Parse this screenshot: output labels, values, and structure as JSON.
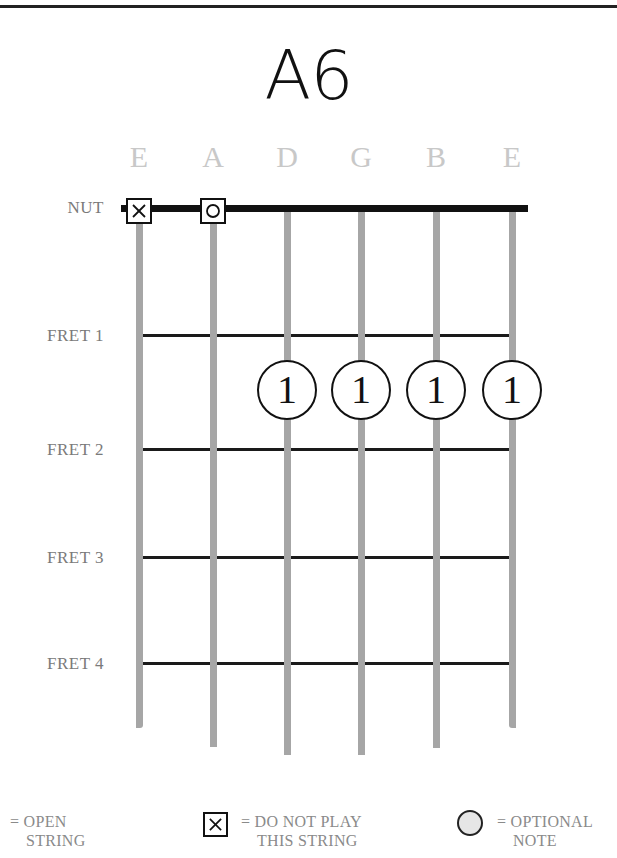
{
  "chord": {
    "name": "A6"
  },
  "strings": [
    {
      "name": "E",
      "x": 139,
      "bottom": 728,
      "marker": "x"
    },
    {
      "name": "A",
      "x": 213,
      "bottom": 747,
      "marker": "o"
    },
    {
      "name": "D",
      "x": 287,
      "bottom": 755,
      "marker": null
    },
    {
      "name": "G",
      "x": 361,
      "bottom": 755,
      "marker": null
    },
    {
      "name": "B",
      "x": 436,
      "bottom": 748,
      "marker": null
    },
    {
      "name": "E",
      "x": 512,
      "bottom": 728,
      "marker": null
    }
  ],
  "nut_label": "NUT",
  "frets": [
    {
      "label": "FRET 1",
      "y": 334
    },
    {
      "label": "FRET 2",
      "y": 448
    },
    {
      "label": "FRET 3",
      "y": 556
    },
    {
      "label": "FRET 4",
      "y": 662
    }
  ],
  "markers": {
    "mute_glyph": "✕",
    "open_glyph": "○"
  },
  "fingers": [
    {
      "string": "D",
      "fret": 2,
      "finger": "1",
      "x": 287,
      "y": 390
    },
    {
      "string": "G",
      "fret": 2,
      "finger": "1",
      "x": 361,
      "y": 390
    },
    {
      "string": "B",
      "fret": 2,
      "finger": "1",
      "x": 436,
      "y": 390
    },
    {
      "string": "E",
      "fret": 2,
      "finger": "1",
      "x": 512,
      "y": 390
    }
  ],
  "legend": {
    "open": {
      "line1": "= OPEN",
      "line2": "STRING"
    },
    "mute": {
      "line1": "= DO NOT PLAY",
      "line2": "THIS STRING"
    },
    "optional": {
      "line1": "= OPTIONAL",
      "line2": "NOTE"
    }
  },
  "colors": {
    "string": "#a6a6a6",
    "fret": "#1a1a1a",
    "nut": "#111111",
    "string_name": "#c8c8c8",
    "label": "#7a7a7a",
    "optional_fill": "#e6e6e6"
  }
}
